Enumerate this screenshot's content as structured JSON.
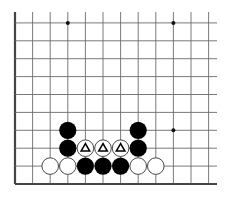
{
  "board": {
    "description": "Go board corner diagram (lower-left region)",
    "grid": {
      "origin_x": 15,
      "top_y": 23,
      "bottom_y": 184,
      "col_step": 17.6,
      "row_step": 17.9,
      "cols": 12,
      "rows": 10,
      "right_extent_x": 217,
      "top_extent_y": 12
    },
    "colors": {
      "line": "#6b6b6b",
      "edge": "#444444",
      "black_stone": "#000000",
      "white_stone": "#ffffff",
      "white_stone_stroke": "#333333",
      "marker": "#000000"
    },
    "star_points": [
      {
        "col": 3,
        "row": 9
      },
      {
        "col": 9,
        "row": 9
      },
      {
        "col": 9,
        "row": 3
      }
    ],
    "stones": [
      {
        "color": "white",
        "col": 2,
        "row": 1,
        "marker": ""
      },
      {
        "color": "white",
        "col": 3,
        "row": 1,
        "marker": ""
      },
      {
        "color": "black",
        "col": 4,
        "row": 1,
        "marker": ""
      },
      {
        "color": "black",
        "col": 5,
        "row": 1,
        "marker": ""
      },
      {
        "color": "black",
        "col": 6,
        "row": 1,
        "marker": ""
      },
      {
        "color": "white",
        "col": 7,
        "row": 1,
        "marker": ""
      },
      {
        "color": "white",
        "col": 8,
        "row": 1,
        "marker": ""
      },
      {
        "color": "black",
        "col": 3,
        "row": 2,
        "marker": ""
      },
      {
        "color": "white",
        "col": 4,
        "row": 2,
        "marker": "triangle"
      },
      {
        "color": "white",
        "col": 5,
        "row": 2,
        "marker": "triangle"
      },
      {
        "color": "white",
        "col": 6,
        "row": 2,
        "marker": "triangle"
      },
      {
        "color": "black",
        "col": 7,
        "row": 2,
        "marker": ""
      },
      {
        "color": "black",
        "col": 3,
        "row": 3,
        "marker": ""
      },
      {
        "color": "black",
        "col": 7,
        "row": 3,
        "marker": ""
      }
    ]
  }
}
